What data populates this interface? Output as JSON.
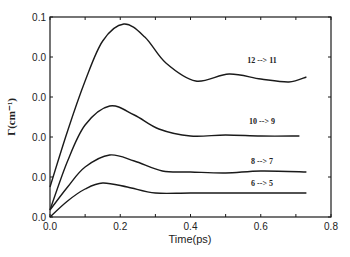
{
  "chart_data": {
    "type": "line",
    "title": "",
    "xlabel": "Time(ps)",
    "ylabel": "Γ(cm⁻¹)",
    "xlim": [
      0,
      0.8
    ],
    "ylim": [
      0,
      0.1
    ],
    "grid": false,
    "legend_position": "inline labels near curve ends",
    "x_ticks": [
      0.0,
      0.2,
      0.4,
      0.6,
      0.8
    ],
    "x_tick_labels": [
      "0.0",
      "0.2",
      "0.4",
      "0.6",
      "0.8"
    ],
    "y_ticks": [
      0.0,
      0.02,
      0.04,
      0.06,
      0.08,
      0.1
    ],
    "y_tick_labels": [
      "0.0",
      "0.0",
      "0.0",
      "0.0",
      "0.0",
      "0.1"
    ],
    "series": [
      {
        "name": "12 --> 11",
        "x": [
          0.0,
          0.05,
          0.1,
          0.15,
          0.21,
          0.27,
          0.33,
          0.415,
          0.51,
          0.6,
          0.68,
          0.73
        ],
        "y": [
          0.015,
          0.043,
          0.068,
          0.088,
          0.0965,
          0.09,
          0.077,
          0.068,
          0.0715,
          0.069,
          0.0675,
          0.07
        ]
      },
      {
        "name": "10 --> 9",
        "x": [
          0.0,
          0.05,
          0.1,
          0.17,
          0.24,
          0.31,
          0.4,
          0.5,
          0.6,
          0.71
        ],
        "y": [
          0.0035,
          0.028,
          0.046,
          0.0555,
          0.051,
          0.044,
          0.0405,
          0.041,
          0.0405,
          0.0405
        ]
      },
      {
        "name": "8 --> 7",
        "x": [
          0.0,
          0.05,
          0.1,
          0.17,
          0.24,
          0.32,
          0.4,
          0.5,
          0.6,
          0.73
        ],
        "y": [
          0.0035,
          0.015,
          0.025,
          0.031,
          0.028,
          0.023,
          0.0225,
          0.022,
          0.023,
          0.0225
        ]
      },
      {
        "name": "6 --> 5",
        "x": [
          0.0,
          0.05,
          0.1,
          0.15,
          0.22,
          0.3,
          0.4,
          0.55,
          0.73
        ],
        "y": [
          0.0,
          0.008,
          0.014,
          0.017,
          0.015,
          0.012,
          0.012,
          0.012,
          0.012
        ]
      }
    ]
  },
  "labels": {
    "xlabel": "Time(ps)",
    "ylabel": "Γ(cm⁻¹)",
    "series": [
      "12 --> 11",
      "10 --> 9",
      "8 --> 7",
      "6 --> 5"
    ]
  }
}
